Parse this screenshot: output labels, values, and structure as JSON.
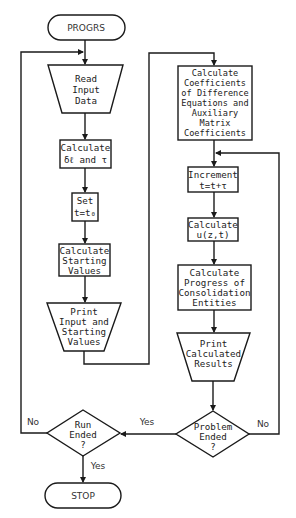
{
  "flowchart": {
    "nodes": {
      "start": {
        "type": "terminal",
        "lines": [
          "PROGRS"
        ]
      },
      "read_input": {
        "type": "manual-input",
        "lines": [
          "Read",
          "Input",
          "Data"
        ]
      },
      "calc_delta": {
        "type": "process",
        "lines": [
          "Calculate",
          "δℓ and τ"
        ]
      },
      "set_t": {
        "type": "process",
        "lines": [
          "Set",
          "t=t₀"
        ]
      },
      "calc_start": {
        "type": "process",
        "lines": [
          "Calculate",
          "Starting",
          "Values"
        ]
      },
      "print_input": {
        "type": "output",
        "lines": [
          "Print",
          "Input and",
          "Starting",
          "Values"
        ]
      },
      "calc_coeff": {
        "type": "process",
        "lines": [
          "Calculate",
          "Coefficients",
          "of Difference",
          "Equations and",
          "Auxiliary",
          "Matrix",
          "Coefficients"
        ]
      },
      "increment": {
        "type": "process",
        "lines": [
          "Increment",
          "t=t+τ"
        ]
      },
      "calc_u": {
        "type": "process",
        "lines": [
          "Calculate",
          "u(z,t)"
        ]
      },
      "calc_progress": {
        "type": "process",
        "lines": [
          "Calculate",
          "Progress of",
          "Consolidation",
          "Entities"
        ]
      },
      "print_results": {
        "type": "output",
        "lines": [
          "Print",
          "Calculated",
          "Results"
        ]
      },
      "problem_ended": {
        "type": "decision",
        "lines": [
          "Problem",
          "Ended",
          "?"
        ]
      },
      "run_ended": {
        "type": "decision",
        "lines": [
          "Run",
          "Ended",
          "?"
        ]
      },
      "stop": {
        "type": "terminal",
        "lines": [
          "STOP"
        ]
      }
    },
    "edge_labels": {
      "run_no": "No",
      "run_yes_in": "Yes",
      "run_yes_out": "Yes",
      "problem_no": "No"
    }
  }
}
